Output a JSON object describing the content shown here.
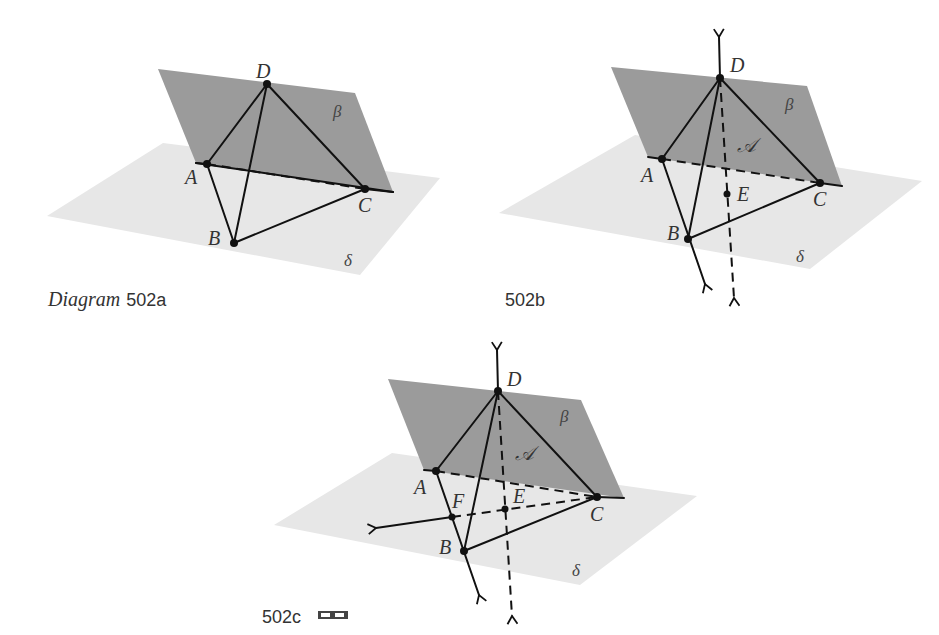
{
  "figures": [
    {
      "id": "502a",
      "caption_prefix": "Diagram",
      "caption_number": "502a",
      "labels": {
        "D": "D",
        "A": "A",
        "B": "B",
        "C": "C",
        "beta": "β",
        "delta": "δ"
      }
    },
    {
      "id": "502b",
      "caption_number": "502b",
      "labels": {
        "D": "D",
        "A": "A",
        "B": "B",
        "C": "C",
        "E": "E",
        "beta": "β",
        "delta": "δ",
        "script_a": "𝒜"
      }
    },
    {
      "id": "502c",
      "caption_number": "502c",
      "caption_icon": "3d-glasses-icon",
      "labels": {
        "D": "D",
        "A": "A",
        "B": "B",
        "C": "C",
        "E": "E",
        "F": "F",
        "beta": "β",
        "delta": "δ",
        "script_a": "𝒜"
      }
    }
  ],
  "colors": {
    "beta_plane": "#9b9b9b",
    "delta_plane": "#e7e7e7",
    "lines": "#111111"
  }
}
